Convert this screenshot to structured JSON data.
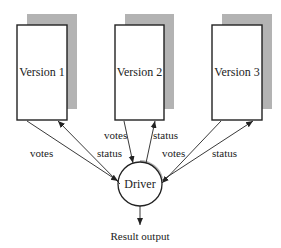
{
  "diagram": {
    "versions": [
      {
        "label": "Version 1",
        "x": 17,
        "y": 25,
        "w": 50,
        "h": 95
      },
      {
        "label": "Version 2",
        "x": 115,
        "y": 25,
        "w": 49,
        "h": 95
      },
      {
        "label": "Version 3",
        "x": 212,
        "y": 25,
        "w": 50,
        "h": 95
      }
    ],
    "driver": {
      "label": "Driver",
      "cx": 140,
      "cy": 184,
      "r": 22
    },
    "edge_labels": {
      "v1_votes": "votes",
      "v1_status": "status",
      "v2_votes": "votes",
      "v2_status": "status",
      "v3_votes": "votes",
      "v3_status": "status"
    },
    "output_label": "Result output",
    "colors": {
      "shadow": "#b3b3b3",
      "stroke": "#222222",
      "fill": "#ffffff"
    }
  }
}
